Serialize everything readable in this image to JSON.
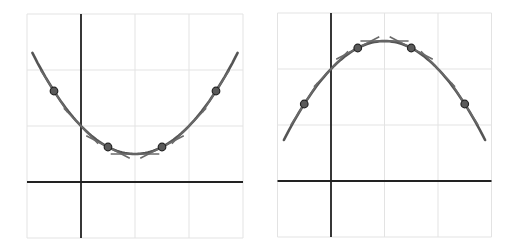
{
  "chart_data": [
    {
      "type": "line",
      "title": "",
      "xlabel": "",
      "ylabel": "",
      "grid": true,
      "xlim": [
        -1,
        3
      ],
      "ylim": [
        -1,
        3
      ],
      "equation": "y = 0.5 + 0.5(x-1)^2",
      "series": [
        {
          "name": "curve",
          "a": 0.5,
          "h": 1,
          "k": 0.5,
          "x_range": [
            -0.9,
            2.9
          ]
        },
        {
          "name": "points",
          "points": [
            [
              -0.5,
              1.625
            ],
            [
              0.5,
              0.625
            ],
            [
              1.5,
              0.625
            ],
            [
              2.5,
              1.625
            ]
          ]
        }
      ],
      "tangent_half_length": 0.5
    },
    {
      "type": "line",
      "title": "",
      "xlabel": "",
      "ylabel": "",
      "grid": true,
      "xlim": [
        -1,
        3
      ],
      "ylim": [
        -1,
        3
      ],
      "equation": "y = 2.5 - 0.5(x-1)^2",
      "series": [
        {
          "name": "curve",
          "a": -0.5,
          "h": 1,
          "k": 2.5,
          "x_range": [
            -0.88,
            2.88
          ]
        },
        {
          "name": "points",
          "points": [
            [
              -0.5,
              1.375
            ],
            [
              0.5,
              2.375
            ],
            [
              1.5,
              2.375
            ],
            [
              2.5,
              1.375
            ]
          ]
        }
      ],
      "tangent_half_length": 0.5
    }
  ],
  "style": {
    "grid_color": "#e3e3e3",
    "axis_color": "#222222",
    "curve_color": "#555555",
    "point_fill": "#5a5a5a",
    "point_stroke": "#222222"
  }
}
